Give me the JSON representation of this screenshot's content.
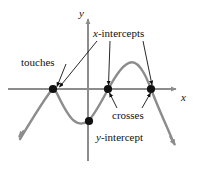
{
  "figure": {
    "colors": {
      "curve": "#8c8c8c",
      "axis": "#8c8c8c",
      "dot": "#111111",
      "leader": "#111111",
      "text": "#111111",
      "background": "#ffffff"
    }
  },
  "labels": {
    "touches": "touches",
    "x_intercepts": "x-intercepts",
    "crosses": "crosses",
    "y_intercept": "y-intercept",
    "x_axis": "x",
    "y_axis": "y"
  },
  "chart_data": {
    "type": "line",
    "title": "",
    "xlabel": "x",
    "ylabel": "y",
    "grid": false,
    "legend": null,
    "annotations": [
      {
        "text": "touches",
        "points_to": "left-x-intercept",
        "kind": "tangent-root"
      },
      {
        "text": "x-intercepts",
        "points_to": [
          "left-x-intercept",
          "middle-x-intercept",
          "right-x-intercept"
        ],
        "kind": "roots"
      },
      {
        "text": "crosses",
        "points_to": [
          "middle-x-intercept",
          "right-x-intercept"
        ],
        "kind": "simple-root"
      },
      {
        "text": "y-intercept",
        "points_to": "y-intercept-point",
        "kind": "y-axis-crossing"
      }
    ],
    "markers": [
      {
        "name": "left-x-intercept",
        "x_px": 53,
        "y_px": 89,
        "on": "x-axis",
        "behavior": "touches"
      },
      {
        "name": "middle-x-intercept",
        "x_px": 108,
        "y_px": 89,
        "on": "x-axis",
        "behavior": "crosses"
      },
      {
        "name": "right-x-intercept",
        "x_px": 151,
        "y_px": 89,
        "on": "x-axis",
        "behavior": "crosses"
      },
      {
        "name": "y-intercept-point",
        "x_px": 88,
        "y_px": 121,
        "on": "y-axis",
        "behavior": "crosses"
      }
    ],
    "axes": {
      "x_axis": {
        "y_px": 89,
        "from_px": 8,
        "to_px": 178,
        "arrow": "right"
      },
      "y_axis": {
        "x_px": 88,
        "from_px": 160,
        "to_px": 17,
        "arrow": "up"
      }
    },
    "curve_shape": "quartic-like: falls from lower-left, rises to touch x-axis at left root, dips to local minimum below axis, rises crossing y-axis below origin, crosses x-axis at middle root, peaks above axis, crosses x-axis at right root, falls to lower-right",
    "curve_points_px": [
      [
        18,
        137
      ],
      [
        24,
        130
      ],
      [
        31,
        121
      ],
      [
        38,
        110
      ],
      [
        45,
        99
      ],
      [
        50,
        92
      ],
      [
        53,
        89
      ],
      [
        57,
        93
      ],
      [
        62,
        103
      ],
      [
        68,
        114
      ],
      [
        74,
        121
      ],
      [
        80,
        123
      ],
      [
        85,
        122
      ],
      [
        88,
        121
      ],
      [
        93,
        115
      ],
      [
        99,
        105
      ],
      [
        104,
        95
      ],
      [
        108,
        89
      ],
      [
        113,
        81
      ],
      [
        119,
        72
      ],
      [
        126,
        65
      ],
      [
        132,
        63
      ],
      [
        138,
        66
      ],
      [
        143,
        73
      ],
      [
        147,
        81
      ],
      [
        151,
        89
      ],
      [
        155,
        98
      ],
      [
        160,
        109
      ],
      [
        166,
        122
      ],
      [
        171,
        134
      ],
      [
        175,
        144
      ]
    ]
  }
}
